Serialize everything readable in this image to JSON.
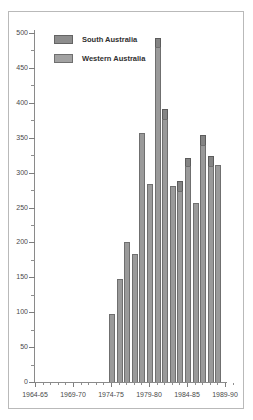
{
  "figure": {
    "background": "#ffffff",
    "frame_color": "#b9b9b9"
  },
  "legend": {
    "position": "upper-left-inside",
    "entries": [
      {
        "label": "South Australia",
        "swatch": "sa",
        "color": "#8d8d8d",
        "icon": "legend-swatch-icon"
      },
      {
        "label": "Western Australia",
        "swatch": "wa",
        "color": "#a2a2a2",
        "icon": "legend-swatch-icon"
      }
    ]
  },
  "axes": {
    "y": {
      "label": "",
      "min": 0,
      "max": 510,
      "major_ticks": [
        0,
        50,
        100,
        150,
        200,
        250,
        300,
        350,
        400,
        450,
        500
      ],
      "major_tick_labels": [
        "0",
        "50",
        "100",
        "150",
        "200",
        "250",
        "300",
        "350",
        "400",
        "450",
        "500"
      ],
      "minor_ticks": [
        25,
        75,
        125,
        175,
        225,
        275,
        325,
        375,
        425,
        475
      ],
      "pixel_zero": 382,
      "pixel_per_unit": 0.698
    },
    "x": {
      "label": "",
      "major_tick_labels": [
        "1964-65",
        "1969-70",
        "1974-75",
        "1979-80",
        "1984-85",
        "1989-90"
      ],
      "major_tick_years": [
        1964,
        1969,
        1974,
        1979,
        1984,
        1989
      ],
      "minor_tick_years": [
        1965,
        1966,
        1967,
        1968,
        1970,
        1971,
        1972,
        1973,
        1975,
        1976,
        1977,
        1978,
        1980,
        1981,
        1982,
        1983,
        1985,
        1986,
        1987,
        1988,
        1990
      ],
      "pixel_origin": 35,
      "pixel_per_year": 7.6
    },
    "grid": false
  },
  "chart_data": {
    "type": "bar",
    "stacked": true,
    "title": "",
    "xlabel": "",
    "ylabel": "",
    "ylim": [
      0,
      510
    ],
    "grid": false,
    "legend_position": "upper-left-inside",
    "categories": [
      "1974-75",
      "1975-76",
      "1976-77",
      "1977-78",
      "1978-79",
      "1979-80",
      "1980-81",
      "1981-82",
      "1982-83",
      "1983-84",
      "1984-85",
      "1985-86",
      "1986-87",
      "1987-88",
      "1988-89",
      "1989-90"
    ],
    "series": [
      {
        "name": "Western Australia",
        "color": "#9a9a9a",
        "values": [
          97,
          148,
          200,
          183,
          357,
          284,
          480,
          377,
          281,
          274,
          309,
          256,
          340,
          309,
          311,
          0
        ]
      },
      {
        "name": "South Australia",
        "color": "#848484",
        "values": [
          0,
          0,
          0,
          0,
          0,
          0,
          13,
          14,
          0,
          14,
          12,
          0,
          14,
          15,
          0,
          0
        ]
      }
    ],
    "totals": [
      97,
      148,
      200,
      183,
      357,
      284,
      493,
      391,
      281,
      288,
      321,
      256,
      354,
      324,
      311,
      0
    ]
  }
}
